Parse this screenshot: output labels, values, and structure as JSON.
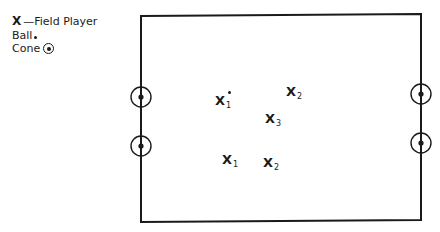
{
  "legend": {
    "field_player_symbol": "X",
    "field_player_label": "—Field Player",
    "ball_label": "Ball",
    "cone_label": "Cone"
  },
  "field": {
    "stroke_color": "#1a1a1a",
    "corners": {
      "top_left": [
        141,
        16
      ],
      "top_right": [
        421,
        14
      ],
      "bottom_right": [
        421,
        220
      ],
      "bottom_left": [
        141,
        222
      ]
    },
    "cones": [
      {
        "side": "left",
        "x": 141,
        "y": 97
      },
      {
        "side": "left",
        "x": 141,
        "y": 146
      },
      {
        "side": "right",
        "x": 421,
        "y": 94
      },
      {
        "side": "right",
        "x": 421,
        "y": 143
      }
    ]
  },
  "players": [
    {
      "symbol": "X",
      "sub": "1",
      "has_ball": true
    },
    {
      "symbol": "X",
      "sub": "2"
    },
    {
      "symbol": "X",
      "sub": "3"
    },
    {
      "symbol": "X",
      "sub": "1"
    },
    {
      "symbol": "X",
      "sub": "2"
    }
  ]
}
